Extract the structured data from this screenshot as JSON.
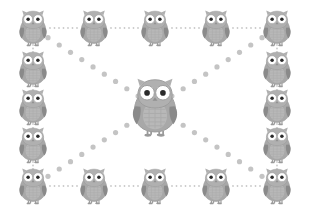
{
  "diagram": {
    "type": "node-link-graph",
    "canvas": {
      "width": 309,
      "height": 214,
      "background": "#ffffff"
    },
    "colors": {
      "background": "#ffffff",
      "owl_body": "#a8a8a8",
      "owl_belly": "#b8b8b8",
      "owl_head": "#b0b0b0",
      "owl_wing": "#8a8a8a",
      "owl_eye_white": "#ffffff",
      "owl_eye_pupil": "#2b2b2b",
      "owl_beak": "#909090",
      "owl_feet": "#9a9a9a",
      "owl_outline": "#9c9c9c",
      "perimeter_edge_dot": "#c9c9c9",
      "diagonal_edge_dot": "#c4c4c4"
    },
    "node_counts": {
      "perimeter_nodes": 16,
      "center_nodes": 1,
      "total_nodes": 17
    },
    "edge_styles": {
      "perimeter": {
        "style": "dotted",
        "dot_radius": 0.9,
        "dot_gap": 4.2,
        "color": "#c9c9c9"
      },
      "diagonal": {
        "style": "dotted",
        "dot_radius": 2.6,
        "dot_gap": 13.5,
        "color": "#c4c4c4"
      }
    },
    "nodes": [
      {
        "id": "n-tl",
        "label": "owl-top-left",
        "x": 33,
        "y": 28,
        "scale": 1.0,
        "role": "corner"
      },
      {
        "id": "n-t1",
        "label": "owl-top-1",
        "x": 94,
        "y": 28,
        "scale": 1.0,
        "role": "edge"
      },
      {
        "id": "n-t2",
        "label": "owl-top-2",
        "x": 155,
        "y": 28,
        "scale": 1.0,
        "role": "edge"
      },
      {
        "id": "n-t3",
        "label": "owl-top-3",
        "x": 216,
        "y": 28,
        "scale": 1.0,
        "role": "edge"
      },
      {
        "id": "n-tr",
        "label": "owl-top-right",
        "x": 277,
        "y": 28,
        "scale": 1.0,
        "role": "corner"
      },
      {
        "id": "n-r1",
        "label": "owl-right-1",
        "x": 277,
        "y": 69,
        "scale": 1.0,
        "role": "edge"
      },
      {
        "id": "n-r2",
        "label": "owl-right-2",
        "x": 277,
        "y": 107,
        "scale": 1.0,
        "role": "edge"
      },
      {
        "id": "n-r3",
        "label": "owl-right-3",
        "x": 277,
        "y": 145,
        "scale": 1.0,
        "role": "edge"
      },
      {
        "id": "n-br",
        "label": "owl-bottom-right",
        "x": 277,
        "y": 186,
        "scale": 1.0,
        "role": "corner"
      },
      {
        "id": "n-b3",
        "label": "owl-bottom-3",
        "x": 216,
        "y": 186,
        "scale": 1.0,
        "role": "edge"
      },
      {
        "id": "n-b2",
        "label": "owl-bottom-2",
        "x": 155,
        "y": 186,
        "scale": 1.0,
        "role": "edge"
      },
      {
        "id": "n-b1",
        "label": "owl-bottom-1",
        "x": 94,
        "y": 186,
        "scale": 1.0,
        "role": "edge"
      },
      {
        "id": "n-bl",
        "label": "owl-bottom-left",
        "x": 33,
        "y": 186,
        "scale": 1.0,
        "role": "corner"
      },
      {
        "id": "n-l3",
        "label": "owl-left-3",
        "x": 33,
        "y": 145,
        "scale": 1.0,
        "role": "edge"
      },
      {
        "id": "n-l2",
        "label": "owl-left-2",
        "x": 33,
        "y": 107,
        "scale": 1.0,
        "role": "edge"
      },
      {
        "id": "n-l1",
        "label": "owl-left-1",
        "x": 33,
        "y": 69,
        "scale": 1.0,
        "role": "edge"
      },
      {
        "id": "n-c",
        "label": "owl-center-hub",
        "x": 155,
        "y": 107,
        "scale": 1.62,
        "role": "hub"
      }
    ],
    "edges": [
      {
        "from": "n-tl",
        "to": "n-t1",
        "kind": "perimeter"
      },
      {
        "from": "n-t1",
        "to": "n-t2",
        "kind": "perimeter"
      },
      {
        "from": "n-t2",
        "to": "n-t3",
        "kind": "perimeter"
      },
      {
        "from": "n-t3",
        "to": "n-tr",
        "kind": "perimeter"
      },
      {
        "from": "n-tr",
        "to": "n-r1",
        "kind": "perimeter"
      },
      {
        "from": "n-r1",
        "to": "n-r2",
        "kind": "perimeter"
      },
      {
        "from": "n-r2",
        "to": "n-r3",
        "kind": "perimeter"
      },
      {
        "from": "n-r3",
        "to": "n-br",
        "kind": "perimeter"
      },
      {
        "from": "n-br",
        "to": "n-b3",
        "kind": "perimeter"
      },
      {
        "from": "n-b3",
        "to": "n-b2",
        "kind": "perimeter"
      },
      {
        "from": "n-b2",
        "to": "n-b1",
        "kind": "perimeter"
      },
      {
        "from": "n-b1",
        "to": "n-bl",
        "kind": "perimeter"
      },
      {
        "from": "n-bl",
        "to": "n-l3",
        "kind": "perimeter"
      },
      {
        "from": "n-l3",
        "to": "n-l2",
        "kind": "perimeter"
      },
      {
        "from": "n-l2",
        "to": "n-l1",
        "kind": "perimeter"
      },
      {
        "from": "n-l1",
        "to": "n-tl",
        "kind": "perimeter"
      },
      {
        "from": "n-tl",
        "to": "n-br",
        "kind": "diagonal"
      },
      {
        "from": "n-tr",
        "to": "n-bl",
        "kind": "diagonal"
      }
    ]
  }
}
